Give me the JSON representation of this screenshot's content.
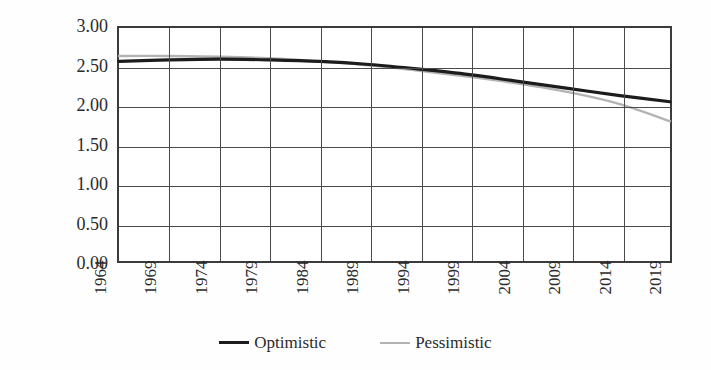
{
  "chart_data": {
    "type": "line",
    "title": "",
    "subtitle": "",
    "xlabel": "",
    "ylabel": "Cable FOS",
    "xlim": [
      1964,
      2019
    ],
    "ylim": [
      0.0,
      3.0
    ],
    "grid": true,
    "legend_position": "bottom-center",
    "y_ticks": [
      "0.00",
      "0.50",
      "1.00",
      "1.50",
      "2.00",
      "2.50",
      "3.00"
    ],
    "y_tick_values": [
      0.0,
      0.5,
      1.0,
      1.5,
      2.0,
      2.5,
      3.0
    ],
    "x_ticks": [
      "1964",
      "1969",
      "1974",
      "1979",
      "1984",
      "1989",
      "1994",
      "1999",
      "2004",
      "2009",
      "2014",
      "2019"
    ],
    "x_tick_values": [
      1964,
      1969,
      1974,
      1979,
      1984,
      1989,
      1994,
      1999,
      2004,
      2009,
      2014,
      2019
    ],
    "x": [
      1964,
      1969,
      1974,
      1979,
      1984,
      1989,
      1994,
      1999,
      2004,
      2009,
      2014,
      2019
    ],
    "series": [
      {
        "name": "Optimistic",
        "color": "#1c1c1c",
        "width": 3.2,
        "values": [
          2.57,
          2.59,
          2.6,
          2.59,
          2.57,
          2.53,
          2.47,
          2.4,
          2.31,
          2.22,
          2.13,
          2.05
        ]
      },
      {
        "name": "Pessimistic",
        "color": "#b3b3b3",
        "width": 2.4,
        "values": [
          2.64,
          2.64,
          2.63,
          2.61,
          2.57,
          2.52,
          2.45,
          2.37,
          2.28,
          2.17,
          2.02,
          1.8
        ]
      }
    ]
  },
  "axes": {
    "y_title": "Cable FOS"
  },
  "legend": {
    "items": [
      {
        "label": "Optimistic",
        "swatch": "line-swatch-dark"
      },
      {
        "label": "Pessimistic",
        "swatch": "line-swatch-gray"
      }
    ]
  },
  "colors": {
    "optimistic": "#1c1c1c",
    "pessimistic": "#b3b3b3",
    "axis": "#3b3b3b",
    "grid": "#4a4a4a",
    "text": "#2b2b2b",
    "background": "#fefefe"
  }
}
